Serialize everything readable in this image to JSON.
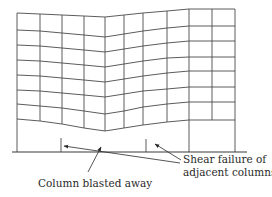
{
  "figure": {
    "width": 272,
    "height": 197,
    "background": "#ffffff",
    "stroke_color": "#3a3a3a",
    "grid_color": "#4a4a4a"
  },
  "frame": {
    "column_x": [
      17,
      40,
      62,
      84,
      105,
      124,
      143,
      167,
      189,
      212,
      235
    ],
    "floor_count": 8,
    "floor_profiles": [
      [
        13,
        14,
        15,
        16,
        17,
        15,
        13,
        11,
        9,
        9,
        9
      ],
      [
        30,
        31,
        33,
        35,
        37,
        34,
        31,
        28,
        26,
        26,
        26
      ],
      [
        45,
        46,
        48,
        50,
        52,
        49,
        46,
        43,
        41,
        41,
        41
      ],
      [
        60,
        61,
        63,
        65,
        67,
        64,
        61,
        58,
        57,
        57,
        57
      ],
      [
        75,
        76,
        78,
        80,
        82,
        79,
        76,
        73,
        71,
        71,
        71
      ],
      [
        90,
        91,
        93,
        95,
        97,
        94,
        91,
        89,
        87,
        87,
        87
      ],
      [
        104,
        106,
        108,
        111,
        114,
        111,
        107,
        104,
        102,
        102,
        102
      ],
      [
        119,
        121,
        124,
        128,
        131,
        128,
        125,
        122,
        120,
        120,
        120
      ]
    ],
    "full_height_columns": [
      0,
      8,
      10
    ],
    "ground_y": 152,
    "ground_x_start": 12,
    "ground_x_end": 247,
    "stubs": [
      {
        "x": 61,
        "y_top": 138
      },
      {
        "x": 146,
        "y_top": 139
      }
    ]
  },
  "annotations": {
    "column_blasted": {
      "text": "Column blasted away",
      "x": 38,
      "y": 177,
      "arrow": {
        "x1": 88,
        "y1": 172,
        "x2": 101,
        "y2": 147
      }
    },
    "shear_failure": {
      "line1": "Shear failure of",
      "line2": "adjacent columns",
      "x": 183,
      "y": 153,
      "arrows": [
        {
          "x1": 180,
          "y1": 163,
          "x2": 64,
          "y2": 146
        },
        {
          "x1": 181,
          "y1": 160,
          "x2": 155,
          "y2": 144
        }
      ]
    }
  }
}
